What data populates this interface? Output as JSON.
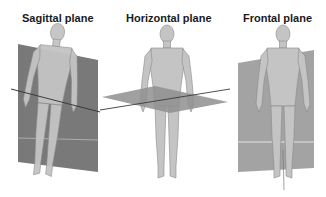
{
  "diagram": {
    "panels": [
      {
        "id": "sagittal",
        "title": "Sagittal plane"
      },
      {
        "id": "horizontal",
        "title": "Horizontal plane"
      },
      {
        "id": "frontal",
        "title": "Frontal plane"
      }
    ],
    "colors": {
      "background": "#ffffff",
      "plane_dark": "#6e6e6e",
      "plane_mid": "#8f8f8f",
      "plane_light": "#9e9e9e",
      "figure": "#c4c4c4",
      "figure_outline": "#8a8a8a",
      "axis_line": "#3a3a3a",
      "title": "#1a1a1a"
    }
  }
}
